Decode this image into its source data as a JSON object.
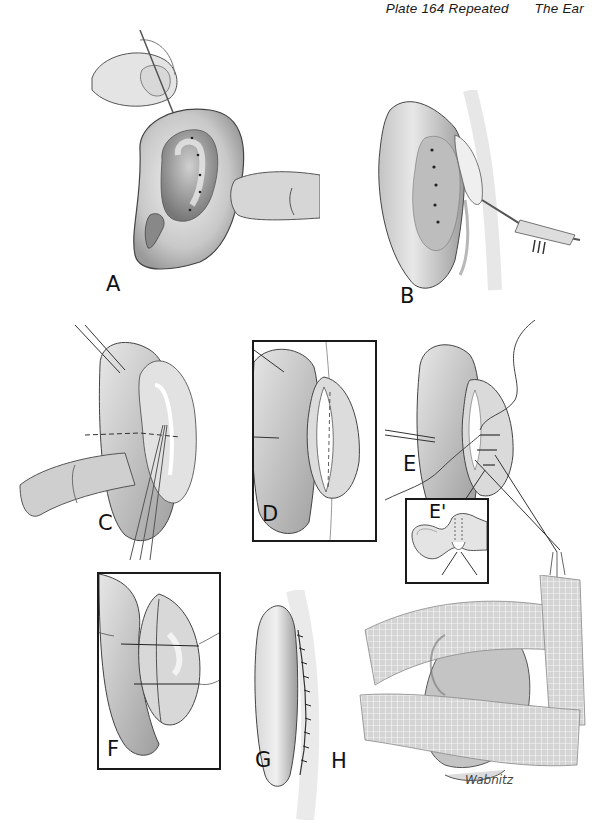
{
  "header": {
    "plate": "Plate 164 Repeated",
    "section": "The Ear"
  },
  "panels": [
    {
      "id": "A",
      "label": "A",
      "description": "ear with needle marking dots"
    },
    {
      "id": "B",
      "label": "B",
      "description": "posterior view with scalpel incision"
    },
    {
      "id": "C",
      "label": "C",
      "description": "ear retracted with sutures"
    },
    {
      "id": "D",
      "label": "D",
      "description": "framed incision view"
    },
    {
      "id": "E",
      "label": "E",
      "description": "sutures placed through cartilage"
    },
    {
      "id": "E_prime",
      "label": "E'",
      "description": "cross-section inset"
    },
    {
      "id": "F",
      "label": "F",
      "description": "framed sutures tied"
    },
    {
      "id": "G",
      "label": "G",
      "description": "closed posterior incision"
    },
    {
      "id": "H",
      "label": "H",
      "description": "gauze dressing applied"
    }
  ],
  "signature": "Wabnitz",
  "colors": {
    "ink": "#1a1a1a",
    "skin_light": "#e6e6e6",
    "skin_mid": "#bdbdbd",
    "skin_dark": "#8a8a8a"
  }
}
